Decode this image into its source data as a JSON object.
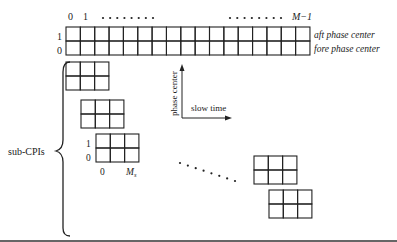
{
  "main_grid": {
    "columns": 17,
    "rows": 2,
    "col_labels": {
      "first": "0",
      "second": "1",
      "last": "M−1"
    },
    "row_labels": [
      "1",
      "0"
    ],
    "row_names": [
      "aft phase center",
      "fore phase center"
    ]
  },
  "axes": {
    "vertical_label": "phase center",
    "horizontal_label": "slow time"
  },
  "sub_cpis": {
    "label": "sub-CPIs",
    "block_columns": 3,
    "block_rows": 2,
    "row_labels": [
      "1",
      "0"
    ],
    "col_labels": {
      "first": "0",
      "last": "M",
      "last_subscript": "s"
    },
    "block_count_shown": 5
  },
  "colors": {
    "stroke": "#222222",
    "background": "#ffffff"
  }
}
